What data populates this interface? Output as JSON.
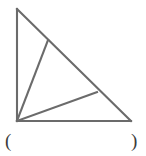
{
  "figure": {
    "name": "right-triangle-with-two-cevians",
    "stroke_color": "#6b6b6b",
    "stroke_width": 2.1,
    "fill_color": "none",
    "background_color": "#ffffff",
    "vertices": {
      "top_left": {
        "label": "top-vertex",
        "x": 17,
        "y": 9
      },
      "bottom_left": {
        "label": "right-angle-vertex",
        "x": 17,
        "y": 121
      },
      "bottom_right": {
        "label": "right-vertex",
        "x": 131,
        "y": 121
      }
    },
    "hypotenuse_points": {
      "upper": {
        "label": "cevian-point-upper",
        "x": 48,
        "y": 40
      },
      "lower": {
        "label": "cevian-point-lower",
        "x": 97,
        "y": 92
      }
    },
    "segments": [
      {
        "name": "left-leg",
        "from": "top_left",
        "to": "bottom_left"
      },
      {
        "name": "bottom-leg",
        "from": "bottom_left",
        "to": "bottom_right"
      },
      {
        "name": "hypotenuse",
        "from": "top_left",
        "to": "bottom_right"
      },
      {
        "name": "cevian-upper",
        "from": "bottom_left",
        "to": "hypotenuse_upper"
      },
      {
        "name": "cevian-lower",
        "from": "bottom_left",
        "to": "hypotenuse_lower"
      }
    ]
  },
  "answer": {
    "open_paren": "(",
    "close_paren": ")",
    "value": ""
  }
}
